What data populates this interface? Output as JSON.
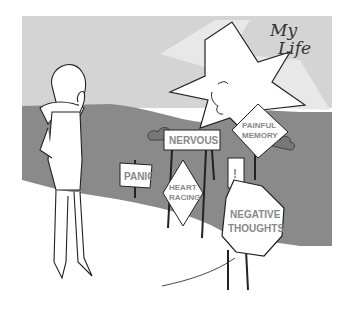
{
  "illustration": {
    "title_lines": [
      "My",
      "Life"
    ],
    "signs": [
      {
        "id": "panic",
        "shape": "rectangle",
        "lines": [
          "PANIC"
        ]
      },
      {
        "id": "nervous",
        "shape": "rectangle",
        "lines": [
          "NERVOUS"
        ]
      },
      {
        "id": "heart-racing",
        "shape": "diamond",
        "lines": [
          "HEART",
          "RACING"
        ]
      },
      {
        "id": "painful-memory",
        "shape": "diamond",
        "lines": [
          "PAINFUL",
          "MEMORY"
        ]
      },
      {
        "id": "exclamation",
        "shape": "rectangle",
        "lines": [
          "!"
        ]
      },
      {
        "id": "negative-thoughts",
        "shape": "octagon",
        "lines": [
          "NEGATIVE",
          "THOUGHTS"
        ]
      }
    ],
    "colors": {
      "sky": "#d4d4d4",
      "ground": "#8a8a8a",
      "sun": "#ffffff",
      "line": "#222222",
      "sign_text": "#888888"
    }
  }
}
